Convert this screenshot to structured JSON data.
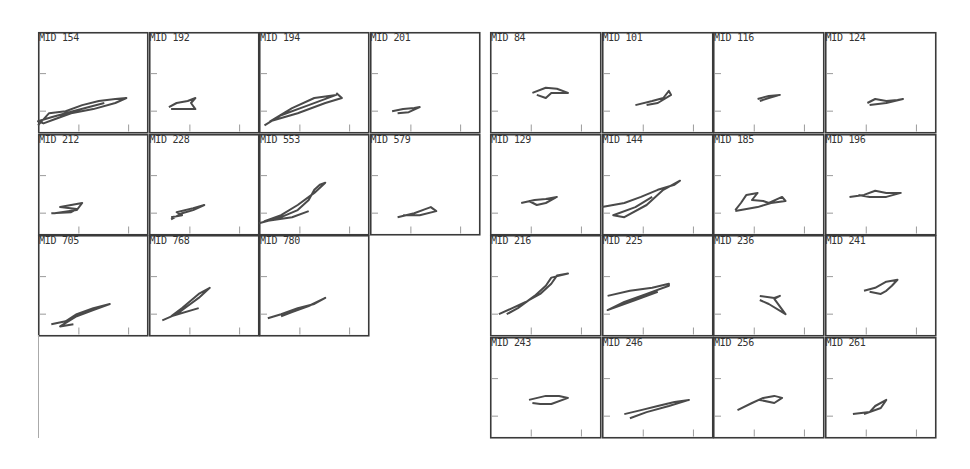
{
  "chart_data": [
    {
      "type": "line",
      "title": "",
      "group": "left",
      "layout": {
        "cols": 4,
        "rows": 4,
        "origin": [
          38,
          32
        ],
        "cell_w": 110.5,
        "cell_h": 101.5,
        "grid": false
      },
      "panels": [
        {
          "label": "MID 154",
          "row": 0,
          "col": 0,
          "trace": [
            [
              0.0,
              0.92
            ],
            [
              0.1,
              0.8
            ],
            [
              0.25,
              0.78
            ],
            [
              0.4,
              0.72
            ],
            [
              0.55,
              0.68
            ],
            [
              0.7,
              0.66
            ],
            [
              0.8,
              0.65
            ],
            [
              0.7,
              0.7
            ],
            [
              0.5,
              0.76
            ],
            [
              0.3,
              0.8
            ],
            [
              0.15,
              0.86
            ],
            [
              0.05,
              0.9
            ],
            [
              0.0,
              0.88
            ],
            [
              0.12,
              0.84
            ],
            [
              0.35,
              0.77
            ],
            [
              0.6,
              0.7
            ]
          ]
        },
        {
          "label": "MID 192",
          "row": 0,
          "col": 1,
          "trace": [
            [
              0.18,
              0.74
            ],
            [
              0.25,
              0.7
            ],
            [
              0.35,
              0.68
            ],
            [
              0.42,
              0.65
            ],
            [
              0.38,
              0.7
            ],
            [
              0.42,
              0.76
            ],
            [
              0.3,
              0.76
            ],
            [
              0.2,
              0.76
            ]
          ]
        },
        {
          "label": "MID 194",
          "row": 0,
          "col": 2,
          "trace": [
            [
              0.05,
              0.92
            ],
            [
              0.2,
              0.82
            ],
            [
              0.45,
              0.72
            ],
            [
              0.7,
              0.62
            ],
            [
              0.5,
              0.65
            ],
            [
              0.3,
              0.75
            ],
            [
              0.1,
              0.88
            ],
            [
              0.35,
              0.8
            ],
            [
              0.6,
              0.7
            ],
            [
              0.75,
              0.65
            ],
            [
              0.7,
              0.6
            ]
          ]
        },
        {
          "label": "MID 201",
          "row": 0,
          "col": 3,
          "trace": [
            [
              0.2,
              0.78
            ],
            [
              0.3,
              0.76
            ],
            [
              0.4,
              0.75
            ],
            [
              0.45,
              0.74
            ],
            [
              0.35,
              0.79
            ],
            [
              0.25,
              0.8
            ]
          ]
        },
        {
          "label": "MID 212",
          "row": 1,
          "col": 0,
          "trace": [
            [
              0.12,
              0.78
            ],
            [
              0.3,
              0.77
            ],
            [
              0.35,
              0.74
            ],
            [
              0.2,
              0.72
            ],
            [
              0.4,
              0.68
            ],
            [
              0.35,
              0.75
            ],
            [
              0.15,
              0.78
            ]
          ]
        },
        {
          "label": "MID 228",
          "row": 1,
          "col": 1,
          "trace": [
            [
              0.2,
              0.82
            ],
            [
              0.3,
              0.8
            ],
            [
              0.25,
              0.77
            ],
            [
              0.4,
              0.73
            ],
            [
              0.5,
              0.7
            ],
            [
              0.4,
              0.75
            ],
            [
              0.3,
              0.78
            ],
            [
              0.2,
              0.84
            ]
          ]
        },
        {
          "label": "MID 553",
          "row": 1,
          "col": 2,
          "trace": [
            [
              0.0,
              0.88
            ],
            [
              0.2,
              0.82
            ],
            [
              0.35,
              0.75
            ],
            [
              0.45,
              0.65
            ],
            [
              0.5,
              0.55
            ],
            [
              0.55,
              0.5
            ],
            [
              0.6,
              0.48
            ],
            [
              0.5,
              0.58
            ],
            [
              0.35,
              0.7
            ],
            [
              0.2,
              0.8
            ],
            [
              0.05,
              0.86
            ],
            [
              0.3,
              0.82
            ],
            [
              0.45,
              0.76
            ]
          ]
        },
        {
          "label": "MID 579",
          "row": 1,
          "col": 3,
          "trace": [
            [
              0.25,
              0.82
            ],
            [
              0.4,
              0.78
            ],
            [
              0.5,
              0.74
            ],
            [
              0.55,
              0.72
            ],
            [
              0.6,
              0.76
            ],
            [
              0.45,
              0.8
            ],
            [
              0.3,
              0.8
            ]
          ]
        },
        {
          "label": "MID 705",
          "row": 2,
          "col": 0,
          "trace": [
            [
              0.12,
              0.88
            ],
            [
              0.25,
              0.85
            ],
            [
              0.35,
              0.78
            ],
            [
              0.5,
              0.72
            ],
            [
              0.65,
              0.68
            ],
            [
              0.5,
              0.74
            ],
            [
              0.35,
              0.8
            ],
            [
              0.2,
              0.9
            ],
            [
              0.32,
              0.88
            ]
          ]
        },
        {
          "label": "MID 768",
          "row": 2,
          "col": 1,
          "trace": [
            [
              0.12,
              0.84
            ],
            [
              0.25,
              0.78
            ],
            [
              0.35,
              0.7
            ],
            [
              0.45,
              0.62
            ],
            [
              0.55,
              0.52
            ],
            [
              0.45,
              0.58
            ],
            [
              0.3,
              0.72
            ],
            [
              0.2,
              0.8
            ],
            [
              0.45,
              0.72
            ]
          ]
        },
        {
          "label": "MID 780",
          "row": 2,
          "col": 2,
          "trace": [
            [
              0.08,
              0.82
            ],
            [
              0.2,
              0.78
            ],
            [
              0.35,
              0.72
            ],
            [
              0.5,
              0.68
            ],
            [
              0.6,
              0.62
            ],
            [
              0.45,
              0.7
            ],
            [
              0.3,
              0.76
            ],
            [
              0.2,
              0.8
            ]
          ]
        }
      ]
    },
    {
      "type": "line",
      "title": "",
      "group": "right",
      "layout": {
        "cols": 4,
        "rows": 4,
        "origin": [
          490,
          32
        ],
        "cell_w": 111.5,
        "cell_h": 101.5,
        "grid": false
      },
      "panels": [
        {
          "label": "MID 84",
          "row": 0,
          "col": 0,
          "trace": [
            [
              0.38,
              0.6
            ],
            [
              0.5,
              0.55
            ],
            [
              0.6,
              0.56
            ],
            [
              0.7,
              0.6
            ],
            [
              0.55,
              0.6
            ],
            [
              0.5,
              0.65
            ],
            [
              0.42,
              0.62
            ]
          ]
        },
        {
          "label": "MID 101",
          "row": 0,
          "col": 1,
          "trace": [
            [
              0.3,
              0.72
            ],
            [
              0.45,
              0.68
            ],
            [
              0.55,
              0.65
            ],
            [
              0.6,
              0.58
            ],
            [
              0.62,
              0.62
            ],
            [
              0.5,
              0.7
            ],
            [
              0.4,
              0.72
            ]
          ]
        },
        {
          "label": "MID 116",
          "row": 0,
          "col": 2,
          "trace": [
            [
              0.4,
              0.66
            ],
            [
              0.5,
              0.63
            ],
            [
              0.6,
              0.62
            ],
            [
              0.5,
              0.65
            ],
            [
              0.42,
              0.68
            ]
          ]
        },
        {
          "label": "MID 124",
          "row": 0,
          "col": 3,
          "trace": [
            [
              0.38,
              0.7
            ],
            [
              0.45,
              0.66
            ],
            [
              0.55,
              0.68
            ],
            [
              0.65,
              0.67
            ],
            [
              0.7,
              0.66
            ],
            [
              0.55,
              0.7
            ],
            [
              0.4,
              0.72
            ]
          ]
        },
        {
          "label": "MID 129",
          "row": 1,
          "col": 0,
          "trace": [
            [
              0.28,
              0.68
            ],
            [
              0.4,
              0.65
            ],
            [
              0.5,
              0.64
            ],
            [
              0.6,
              0.62
            ],
            [
              0.5,
              0.68
            ],
            [
              0.42,
              0.7
            ],
            [
              0.35,
              0.66
            ]
          ]
        },
        {
          "label": "MID 144",
          "row": 1,
          "col": 1,
          "trace": [
            [
              0.0,
              0.72
            ],
            [
              0.2,
              0.68
            ],
            [
              0.35,
              0.62
            ],
            [
              0.5,
              0.55
            ],
            [
              0.65,
              0.5
            ],
            [
              0.7,
              0.46
            ],
            [
              0.55,
              0.55
            ],
            [
              0.4,
              0.7
            ],
            [
              0.2,
              0.82
            ],
            [
              0.1,
              0.8
            ],
            [
              0.3,
              0.72
            ],
            [
              0.45,
              0.62
            ]
          ]
        },
        {
          "label": "MID 185",
          "row": 1,
          "col": 2,
          "trace": [
            [
              0.2,
              0.75
            ],
            [
              0.25,
              0.68
            ],
            [
              0.3,
              0.6
            ],
            [
              0.4,
              0.58
            ],
            [
              0.35,
              0.65
            ],
            [
              0.45,
              0.66
            ],
            [
              0.5,
              0.68
            ],
            [
              0.62,
              0.62
            ],
            [
              0.65,
              0.66
            ],
            [
              0.52,
              0.68
            ],
            [
              0.4,
              0.72
            ],
            [
              0.2,
              0.76
            ]
          ]
        },
        {
          "label": "MID 196",
          "row": 1,
          "col": 3,
          "trace": [
            [
              0.22,
              0.62
            ],
            [
              0.35,
              0.6
            ],
            [
              0.45,
              0.56
            ],
            [
              0.55,
              0.58
            ],
            [
              0.68,
              0.58
            ],
            [
              0.55,
              0.62
            ],
            [
              0.4,
              0.62
            ],
            [
              0.3,
              0.6
            ]
          ]
        },
        {
          "label": "MID 216",
          "row": 2,
          "col": 0,
          "trace": [
            [
              0.08,
              0.78
            ],
            [
              0.2,
              0.72
            ],
            [
              0.32,
              0.66
            ],
            [
              0.45,
              0.58
            ],
            [
              0.55,
              0.48
            ],
            [
              0.6,
              0.4
            ],
            [
              0.7,
              0.38
            ],
            [
              0.55,
              0.42
            ],
            [
              0.5,
              0.5
            ],
            [
              0.4,
              0.6
            ],
            [
              0.25,
              0.72
            ],
            [
              0.15,
              0.78
            ]
          ]
        },
        {
          "label": "MID 225",
          "row": 2,
          "col": 1,
          "trace": [
            [
              0.05,
              0.6
            ],
            [
              0.25,
              0.55
            ],
            [
              0.45,
              0.52
            ],
            [
              0.6,
              0.48
            ],
            [
              0.6,
              0.5
            ],
            [
              0.4,
              0.58
            ],
            [
              0.2,
              0.66
            ],
            [
              0.05,
              0.74
            ],
            [
              0.3,
              0.64
            ],
            [
              0.5,
              0.56
            ]
          ]
        },
        {
          "label": "MID 236",
          "row": 2,
          "col": 2,
          "trace": [
            [
              0.42,
              0.6
            ],
            [
              0.55,
              0.62
            ],
            [
              0.6,
              0.6
            ],
            [
              0.55,
              0.63
            ],
            [
              0.65,
              0.78
            ],
            [
              0.5,
              0.68
            ],
            [
              0.42,
              0.64
            ]
          ]
        },
        {
          "label": "MID 241",
          "row": 2,
          "col": 3,
          "trace": [
            [
              0.35,
              0.55
            ],
            [
              0.45,
              0.52
            ],
            [
              0.55,
              0.46
            ],
            [
              0.65,
              0.44
            ],
            [
              0.6,
              0.5
            ],
            [
              0.55,
              0.55
            ],
            [
              0.5,
              0.58
            ],
            [
              0.4,
              0.56
            ]
          ]
        },
        {
          "label": "MID 243",
          "row": 3,
          "col": 0,
          "trace": [
            [
              0.35,
              0.62
            ],
            [
              0.5,
              0.58
            ],
            [
              0.62,
              0.58
            ],
            [
              0.7,
              0.6
            ],
            [
              0.55,
              0.66
            ],
            [
              0.45,
              0.66
            ],
            [
              0.38,
              0.65
            ]
          ]
        },
        {
          "label": "MID 246",
          "row": 3,
          "col": 1,
          "trace": [
            [
              0.2,
              0.76
            ],
            [
              0.35,
              0.72
            ],
            [
              0.5,
              0.68
            ],
            [
              0.65,
              0.64
            ],
            [
              0.78,
              0.62
            ],
            [
              0.6,
              0.68
            ],
            [
              0.4,
              0.74
            ],
            [
              0.25,
              0.8
            ]
          ]
        },
        {
          "label": "MID 256",
          "row": 3,
          "col": 2,
          "trace": [
            [
              0.22,
              0.72
            ],
            [
              0.35,
              0.65
            ],
            [
              0.45,
              0.6
            ],
            [
              0.55,
              0.58
            ],
            [
              0.62,
              0.6
            ],
            [
              0.55,
              0.65
            ],
            [
              0.42,
              0.62
            ]
          ]
        },
        {
          "label": "MID 261",
          "row": 3,
          "col": 3,
          "trace": [
            [
              0.25,
              0.76
            ],
            [
              0.4,
              0.74
            ],
            [
              0.45,
              0.68
            ],
            [
              0.55,
              0.62
            ],
            [
              0.5,
              0.7
            ],
            [
              0.35,
              0.76
            ]
          ]
        }
      ]
    }
  ],
  "style": {
    "axis_color": "#3a3a3a",
    "trace_color": "#4a4a4a",
    "tick_color": "#9a9a9a",
    "label_color": "#333333"
  }
}
